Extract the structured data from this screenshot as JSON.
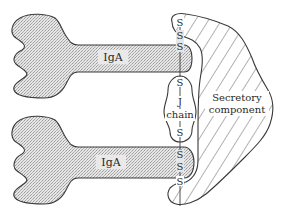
{
  "diagram": {
    "molecules": [
      {
        "id": "iga-top",
        "label": "IgA"
      },
      {
        "id": "iga-bottom",
        "label": "IgA"
      }
    ],
    "j_chain": {
      "label_line1": "J",
      "label_line2": "chain"
    },
    "secretory_component": {
      "label_line1": "Secretory",
      "label_line2": "component"
    },
    "disulfide_labels": {
      "top": [
        "S",
        "S",
        "S",
        "S"
      ],
      "bottom": [
        "S",
        "S",
        "S",
        "S"
      ]
    },
    "colors": {
      "outline": "#3a3a3a",
      "stipple": "#d8d8d8",
      "hatch": "#555555",
      "background": "#ffffff"
    }
  }
}
